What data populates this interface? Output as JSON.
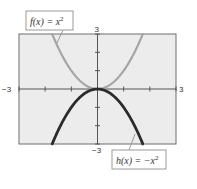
{
  "chart_data": {
    "type": "line",
    "title": "",
    "xlabel": "",
    "ylabel": "",
    "xlim": [
      -3,
      3
    ],
    "ylim": [
      -3,
      3
    ],
    "grid": false,
    "x_tick_labels": {
      "min": "−3",
      "max": "3"
    },
    "y_tick_labels": {
      "min": "−3",
      "max": "3"
    },
    "x_ticks": [
      -3,
      -2,
      -1,
      0,
      1,
      2,
      3
    ],
    "y_ticks": [
      -3,
      -2,
      -1,
      0,
      1,
      2,
      3
    ],
    "series": [
      {
        "name": "f(x) = x^2",
        "label_text": "f(x) = x",
        "label_sup": "2",
        "expression": "x^2",
        "color": "#a6a6a6",
        "x": [
          -1.73,
          -1.5,
          -1.0,
          -0.5,
          0,
          0.5,
          1.0,
          1.5,
          1.73
        ],
        "y": [
          3.0,
          2.25,
          1.0,
          0.25,
          0,
          0.25,
          1.0,
          2.25,
          3.0
        ]
      },
      {
        "name": "h(x) = -x^2",
        "label_text": "h(x) = −x",
        "label_sup": "2",
        "expression": "-x^2",
        "color": "#2b2b2b",
        "x": [
          -1.73,
          -1.5,
          -1.0,
          -0.5,
          0,
          0.5,
          1.0,
          1.5,
          1.73
        ],
        "y": [
          -3.0,
          -2.25,
          -1.0,
          -0.25,
          0,
          -0.25,
          -1.0,
          -2.25,
          -3.0
        ]
      }
    ]
  },
  "colors": {
    "plot_background": "#ececec",
    "frame": "#6e6e6e",
    "axis": "#555555",
    "label_box_border": "#9a9a9a"
  }
}
